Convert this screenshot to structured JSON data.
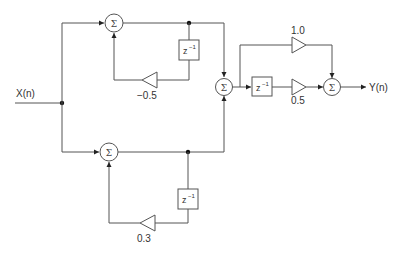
{
  "diagram": {
    "type": "signal-flow block diagram",
    "input_label": "X(n)",
    "output_label": "Y(n)",
    "summer_symbol": "Σ",
    "delay_label": "z",
    "delay_exponent": "−1",
    "branches": {
      "upper_iir": {
        "feedback_gain": "−0.5"
      },
      "lower_iir": {
        "feedback_gain": "0.3"
      },
      "fir": {
        "direct_gain": "1.0",
        "delayed_gain": "0.5"
      }
    },
    "colors": {
      "line": "#555555",
      "junction": "#111111",
      "text": "#333333",
      "background": "#ffffff"
    }
  }
}
